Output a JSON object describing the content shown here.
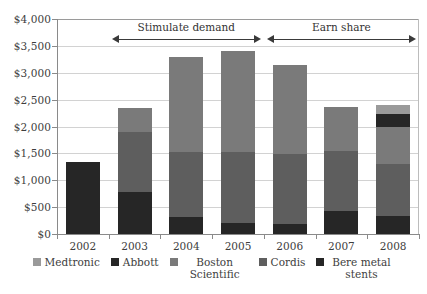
{
  "chart_data": {
    "type": "bar",
    "stacked": true,
    "title": "",
    "subtitle": "",
    "xlabel": "",
    "ylabel": "",
    "categories": [
      "2002",
      "2003",
      "2004",
      "2005",
      "2006",
      "2007",
      "2008"
    ],
    "ylim": [
      0,
      4000
    ],
    "ytick_values": [
      0,
      500,
      1000,
      1500,
      2000,
      2500,
      3000,
      3500,
      4000
    ],
    "ytick_labels": [
      "$0",
      "$500",
      "$1,000",
      "$1,500",
      "$2,000",
      "$2,500",
      "$3,000",
      "$3,500",
      "$4,000"
    ],
    "currency_prefix": "$",
    "grid": true,
    "legend_position": "bottom",
    "series": [
      {
        "name": "Bere metal stents",
        "color": "#262626",
        "values": [
          1340,
          780,
          310,
          200,
          190,
          430,
          340
        ]
      },
      {
        "name": "Cordis",
        "color": "#5e5e5e",
        "values": [
          0,
          1120,
          1220,
          1320,
          1290,
          1120,
          960
        ]
      },
      {
        "name": "Boston Scientific",
        "color": "#7a7a7a",
        "values": [
          0,
          450,
          1760,
          1880,
          1670,
          820,
          700
        ]
      },
      {
        "name": "Abbott",
        "color": "#262626",
        "values": [
          0,
          0,
          0,
          0,
          0,
          0,
          230
        ]
      },
      {
        "name": "Medtronic",
        "color": "#9a9a9a",
        "values": [
          0,
          0,
          0,
          0,
          0,
          0,
          170
        ]
      }
    ],
    "totals": [
      1340,
      2350,
      3290,
      3400,
      3150,
      2370,
      2400
    ],
    "annotations": [
      {
        "id": "stimulate-demand",
        "label": "Stimulate demand",
        "span_start": "2003",
        "span_end": "2005",
        "arrow": "double"
      },
      {
        "id": "earn-share",
        "label": "Earn share",
        "span_start": "2006",
        "span_end": "2008",
        "arrow": "double"
      }
    ]
  },
  "legend": {
    "items": [
      {
        "label": "Medtronic",
        "color": "#9a9a9a",
        "wrap": false
      },
      {
        "label": "Abbott",
        "color": "#262626",
        "wrap": false
      },
      {
        "label": "Boston Scientific",
        "color": "#7a7a7a",
        "wrap": true
      },
      {
        "label": "Cordis",
        "color": "#5e5e5e",
        "wrap": false
      },
      {
        "label": "Bere metal stents",
        "color": "#262626",
        "wrap": true
      }
    ]
  },
  "footer": {
    "note": ""
  }
}
